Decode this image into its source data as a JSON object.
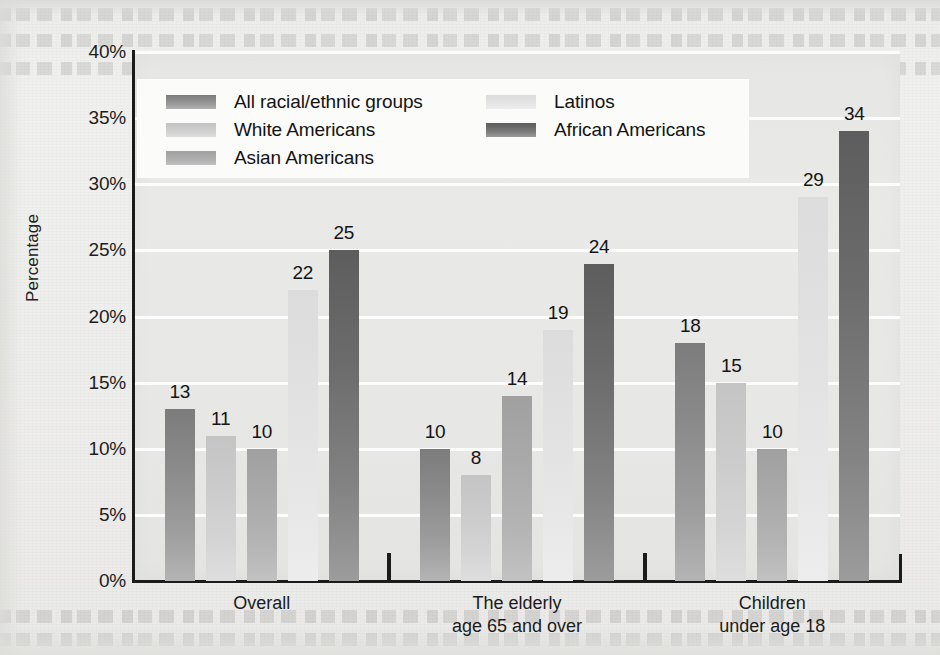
{
  "chart_data": {
    "type": "bar",
    "title": "",
    "xlabel": "",
    "ylabel": "Percentage",
    "ylim": [
      0,
      40
    ],
    "ytick_labels": [
      "0%",
      "5%",
      "10%",
      "15%",
      "20%",
      "25%",
      "30%",
      "35%",
      "40%"
    ],
    "ytick_values": [
      0,
      5,
      10,
      15,
      20,
      25,
      30,
      35,
      40
    ],
    "grid": true,
    "legend_position": "upper-left-inside",
    "categories": [
      "Overall",
      "The elderly\nage 65 and over",
      "Children\nunder age 18"
    ],
    "series": [
      {
        "name": "All racial/ethnic groups",
        "color": "#8b8b8b",
        "values": [
          13,
          10,
          18
        ]
      },
      {
        "name": "White Americans",
        "color": "#cbcbcb",
        "values": [
          11,
          8,
          15
        ]
      },
      {
        "name": "Asian Americans",
        "color": "#a9a9a9",
        "values": [
          10,
          14,
          10
        ]
      },
      {
        "name": "Latinos",
        "color": "#e1e1e1",
        "values": [
          22,
          19,
          29
        ]
      },
      {
        "name": "African Americans",
        "color": "#6c6c6c",
        "values": [
          25,
          24,
          34
        ]
      }
    ],
    "value_labels": [
      [
        "13",
        "11",
        "10",
        "22",
        "25"
      ],
      [
        "10",
        "8",
        "14",
        "19",
        "24"
      ],
      [
        "18",
        "15",
        "10",
        "29",
        "34"
      ]
    ]
  },
  "legend": {
    "column_left": [
      {
        "label": "All racial/ethnic groups",
        "series": 0
      },
      {
        "label": "White Americans",
        "series": 1
      },
      {
        "label": "Asian Americans",
        "series": 2
      }
    ],
    "column_right": [
      {
        "label": "Latinos",
        "series": 3
      },
      {
        "label": "African Americans",
        "series": 4
      }
    ]
  },
  "axis": {
    "y_title": "Percentage",
    "y_ticks": [
      "40%",
      "35%",
      "30%",
      "25%",
      "20%",
      "15%",
      "10%",
      "5%",
      "0%"
    ],
    "x_groups": [
      "Overall",
      "The elderly\nage 65 and over",
      "Children\nunder age 18"
    ]
  }
}
